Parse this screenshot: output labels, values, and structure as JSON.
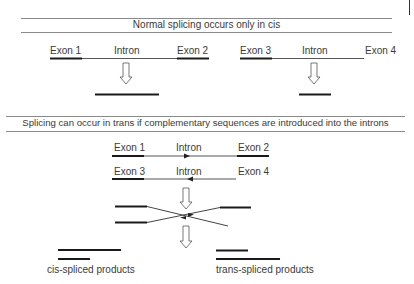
{
  "corner_mark": "|",
  "section_cis": {
    "title": "Normal splicing occurs only in cis",
    "gene_a": {
      "exon_left": "Exon 1",
      "intron": "Intron",
      "exon_right": "Exon 2"
    },
    "gene_b": {
      "exon_left": "Exon 3",
      "intron": "Intron",
      "exon_right": "Exon 4"
    }
  },
  "section_trans": {
    "title": "Splicing can occur in trans if complementary sequences are introduced into the introns",
    "strand_top": {
      "exon_left": "Exon 1",
      "intron": "Intron",
      "exon_right": "Exon 2"
    },
    "strand_bottom": {
      "exon_left": "Exon 3",
      "intron": "Intron",
      "exon_right": "Exon 4"
    },
    "products": {
      "cis_label": "cis-spliced products",
      "trans_label": "trans-spliced products"
    }
  },
  "colors": {
    "line": "#8a8a8a",
    "exon": "#1a1a1a",
    "intron": "#555555",
    "text": "#3a3a3a"
  }
}
